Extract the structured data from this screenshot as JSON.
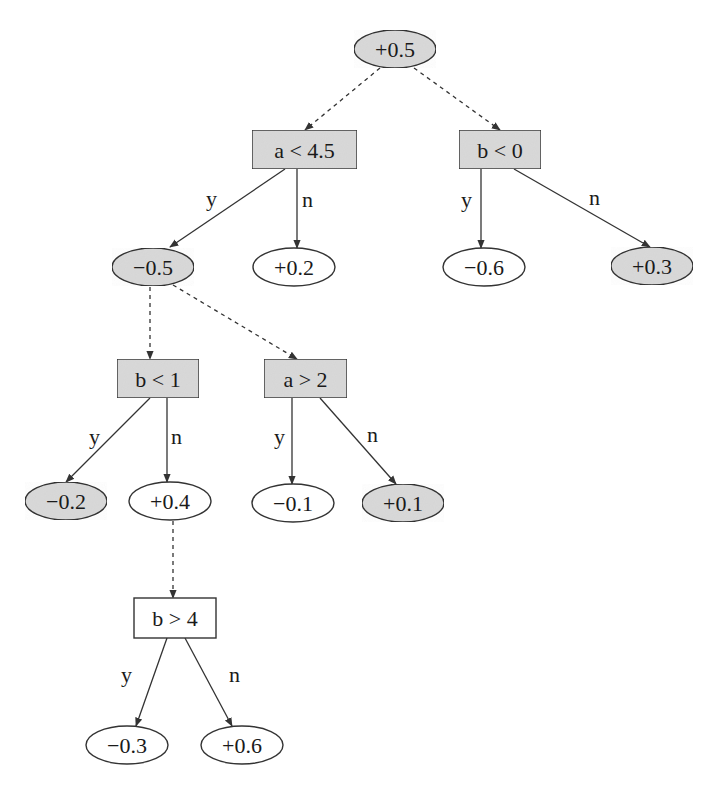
{
  "diagram": {
    "type": "alternating-decision-tree",
    "colors": {
      "shaded_fill": "#d9d9d9",
      "plain_fill": "#ffffff",
      "stroke": "#333333",
      "text": "#1a1a1a"
    },
    "nodes": [
      {
        "id": "root",
        "kind": "prediction",
        "label": "+0.5",
        "shaded": true,
        "cx": 395,
        "cy": 49
      },
      {
        "id": "split-a-lt-4.5",
        "kind": "split",
        "label": "a < 4.5",
        "shaded": true,
        "x": 252,
        "y": 130,
        "w": 105,
        "h": 39
      },
      {
        "id": "split-b-lt-0",
        "kind": "split",
        "label": "b < 0",
        "shaded": true,
        "x": 459,
        "y": 130,
        "w": 82,
        "h": 39
      },
      {
        "id": "pred-m0.5",
        "kind": "prediction",
        "label": "−0.5",
        "shaded": true,
        "cx": 153,
        "cy": 267
      },
      {
        "id": "pred-p0.2",
        "kind": "prediction",
        "label": "+0.2",
        "shaded": false,
        "cx": 294,
        "cy": 267
      },
      {
        "id": "pred-m0.6",
        "kind": "prediction",
        "label": "−0.6",
        "shaded": false,
        "cx": 484,
        "cy": 267
      },
      {
        "id": "pred-p0.3",
        "kind": "prediction",
        "label": "+0.3",
        "shaded": true,
        "cx": 652,
        "cy": 266
      },
      {
        "id": "split-b-lt-1",
        "kind": "split",
        "label": "b < 1",
        "shaded": true,
        "x": 117,
        "y": 359,
        "w": 82,
        "h": 39
      },
      {
        "id": "split-a-gt-2",
        "kind": "split",
        "label": "a > 2",
        "shaded": true,
        "x": 264,
        "y": 359,
        "w": 83,
        "h": 39
      },
      {
        "id": "pred-m0.2",
        "kind": "prediction",
        "label": "−0.2",
        "shaded": true,
        "cx": 66,
        "cy": 501
      },
      {
        "id": "pred-p0.4",
        "kind": "prediction",
        "label": "+0.4",
        "shaded": false,
        "cx": 170,
        "cy": 501
      },
      {
        "id": "pred-m0.1",
        "kind": "prediction",
        "label": "−0.1",
        "shaded": false,
        "cx": 293,
        "cy": 503
      },
      {
        "id": "pred-p0.1",
        "kind": "prediction",
        "label": "+0.1",
        "shaded": true,
        "cx": 403,
        "cy": 503
      },
      {
        "id": "split-b-gt-4",
        "kind": "split",
        "label": "b > 4",
        "shaded": false,
        "x": 134,
        "y": 598,
        "w": 82,
        "h": 40
      },
      {
        "id": "pred-m0.3",
        "kind": "prediction",
        "label": "−0.3",
        "shaded": false,
        "cx": 127,
        "cy": 745
      },
      {
        "id": "pred-p0.6",
        "kind": "prediction",
        "label": "+0.6",
        "shaded": false,
        "cx": 242,
        "cy": 745
      }
    ],
    "edges": [
      {
        "from": "root",
        "to": "split-a-lt-4.5",
        "style": "dashed",
        "x1": 380,
        "y1": 68,
        "x2": 305,
        "y2": 130,
        "label": ""
      },
      {
        "from": "root",
        "to": "split-b-lt-0",
        "style": "dashed",
        "x1": 414,
        "y1": 68,
        "x2": 500,
        "y2": 130,
        "label": ""
      },
      {
        "from": "split-a-lt-4.5",
        "to": "pred-m0.5",
        "style": "solid",
        "x1": 285,
        "y1": 169,
        "x2": 170,
        "y2": 247,
        "label": "y",
        "lx": 206,
        "ly": 206
      },
      {
        "from": "split-a-lt-4.5",
        "to": "pred-p0.2",
        "style": "solid",
        "x1": 297,
        "y1": 169,
        "x2": 297,
        "y2": 248,
        "label": "n",
        "lx": 302,
        "ly": 207
      },
      {
        "from": "split-b-lt-0",
        "to": "pred-m0.6",
        "style": "solid",
        "x1": 481,
        "y1": 169,
        "x2": 481,
        "y2": 248,
        "label": "y",
        "lx": 461,
        "ly": 207
      },
      {
        "from": "split-b-lt-0",
        "to": "pred-p0.3",
        "style": "solid",
        "x1": 514,
        "y1": 169,
        "x2": 650,
        "y2": 247,
        "label": "n",
        "lx": 589,
        "ly": 205
      },
      {
        "from": "pred-m0.5",
        "to": "split-b-lt-1",
        "style": "dashed",
        "x1": 150,
        "y1": 287,
        "x2": 150,
        "y2": 359,
        "label": ""
      },
      {
        "from": "pred-m0.5",
        "to": "split-a-gt-2",
        "style": "dashed",
        "x1": 173,
        "y1": 285,
        "x2": 297,
        "y2": 359,
        "label": ""
      },
      {
        "from": "split-b-lt-1",
        "to": "pred-m0.2",
        "style": "solid",
        "x1": 150,
        "y1": 398,
        "x2": 66,
        "y2": 482,
        "label": "y",
        "lx": 89,
        "ly": 444
      },
      {
        "from": "split-b-lt-1",
        "to": "pred-p0.4",
        "style": "solid",
        "x1": 167,
        "y1": 398,
        "x2": 167,
        "y2": 482,
        "label": "n",
        "lx": 171,
        "ly": 444
      },
      {
        "from": "split-a-gt-2",
        "to": "pred-m0.1",
        "style": "solid",
        "x1": 292,
        "y1": 398,
        "x2": 292,
        "y2": 484,
        "label": "y",
        "lx": 274,
        "ly": 444
      },
      {
        "from": "split-a-gt-2",
        "to": "pred-p0.1",
        "style": "solid",
        "x1": 320,
        "y1": 398,
        "x2": 396,
        "y2": 484,
        "label": "n",
        "lx": 367,
        "ly": 442
      },
      {
        "from": "pred-p0.4",
        "to": "split-b-gt-4",
        "style": "dashed",
        "x1": 173,
        "y1": 521,
        "x2": 173,
        "y2": 598,
        "label": ""
      },
      {
        "from": "split-b-gt-4",
        "to": "pred-m0.3",
        "style": "solid",
        "x1": 167,
        "y1": 638,
        "x2": 136,
        "y2": 726,
        "label": "y",
        "lx": 121,
        "ly": 682
      },
      {
        "from": "split-b-gt-4",
        "to": "pred-p0.6",
        "style": "solid",
        "x1": 185,
        "y1": 638,
        "x2": 232,
        "y2": 726,
        "label": "n",
        "lx": 229,
        "ly": 682
      }
    ]
  },
  "ellipse_size": {
    "rx": 41,
    "ry": 19
  }
}
